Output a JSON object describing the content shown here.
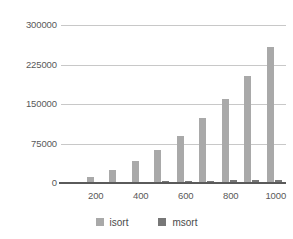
{
  "chart_data": {
    "type": "bar",
    "title": "",
    "subtitle": "",
    "xlabel": "",
    "ylabel": "",
    "categories": [
      100,
      200,
      300,
      400,
      500,
      600,
      700,
      800,
      900,
      1000
    ],
    "xtick_labels": [
      "200",
      "400",
      "600",
      "800",
      "1000"
    ],
    "xtick_categories": [
      200,
      400,
      600,
      800,
      1000
    ],
    "ytick_labels": [
      "0",
      "75000",
      "150000",
      "225000",
      "300000"
    ],
    "ytick_values": [
      0,
      75000,
      150000,
      225000,
      300000
    ],
    "ylim": [
      0,
      300000
    ],
    "grid": true,
    "legend_position": "bottom",
    "series": [
      {
        "name": "isort",
        "color": "#a9a9a9",
        "values": [
          2000,
          12000,
          25000,
          41000,
          62000,
          89000,
          123000,
          159000,
          204000,
          258000
        ]
      },
      {
        "name": "msort",
        "color": "#777777",
        "values": [
          600,
          1300,
          2000,
          2700,
          3400,
          4000,
          4700,
          5300,
          6000,
          6600
        ]
      }
    ]
  },
  "axes": {
    "y": {
      "ticks": [
        {
          "label": "300000",
          "value": 300000
        },
        {
          "label": "225000",
          "value": 225000
        },
        {
          "label": "150000",
          "value": 150000
        },
        {
          "label": "75000",
          "value": 75000
        },
        {
          "label": "0",
          "value": 0
        }
      ]
    },
    "x": {
      "ticks": [
        {
          "label": "200",
          "value": 200
        },
        {
          "label": "400",
          "value": 400
        },
        {
          "label": "600",
          "value": 600
        },
        {
          "label": "800",
          "value": 800
        },
        {
          "label": "1000",
          "value": 1000
        }
      ]
    }
  },
  "legend": {
    "items": [
      {
        "label": "isort",
        "color": "#a9a9a9"
      },
      {
        "label": "msort",
        "color": "#777777"
      }
    ]
  },
  "colors": {
    "isort": "#a9a9a9",
    "msort": "#777777",
    "gridline": "#c8c8c8",
    "axis": "#5a5a5a",
    "text": "#595959",
    "background": "#ffffff"
  }
}
